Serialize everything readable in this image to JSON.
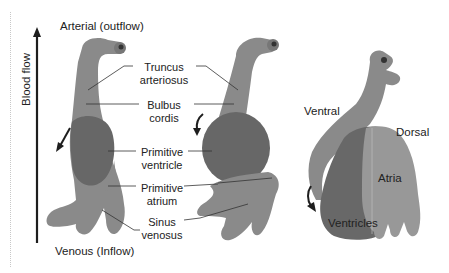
{
  "diagram": {
    "top_label": "Arterial (outflow)",
    "bottom_label": "Venous (Inflow)",
    "axis_label": "Blood flow",
    "structure_labels": [
      {
        "line1": "Truncus",
        "line2": "arteriosus"
      },
      {
        "line1": "Bulbus",
        "line2": "cordis"
      },
      {
        "line1": "Primitive",
        "line2": "ventricle"
      },
      {
        "line1": "Primitive",
        "line2": "atrium"
      },
      {
        "line1": "Sinus",
        "line2": "venosus"
      }
    ],
    "stage3_labels": {
      "ventral": "Ventral",
      "dorsal": "Dorsal",
      "atria": "Atria",
      "ventricles": "Ventricles"
    },
    "colors": {
      "tube": "#8a8a8a",
      "ventricle": "#6a6a6a",
      "atria": "#9a9a9a",
      "arrow": "#1e1e1e"
    }
  }
}
